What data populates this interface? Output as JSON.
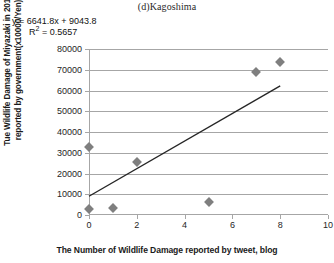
{
  "chart_data": {
    "type": "scatter",
    "title": "(d)Kagoshima",
    "xlabel": "The Number of Wildlife Damage reported by tweet, blog",
    "ylabel_line1": "Tue Wildlife Damage of Miyazaki in 2013",
    "ylabel_line2": "reported by government(x10000/Yen)",
    "x": [
      0,
      0,
      1,
      2,
      5,
      7,
      8
    ],
    "y": [
      33000,
      3000,
      3500,
      25500,
      6500,
      69000,
      73500
    ],
    "points": [
      {
        "x": 0,
        "y": 33000
      },
      {
        "x": 0,
        "y": 3000
      },
      {
        "x": 1,
        "y": 3500
      },
      {
        "x": 2,
        "y": 25500
      },
      {
        "x": 5,
        "y": 6500
      },
      {
        "x": 7,
        "y": 69000
      },
      {
        "x": 8,
        "y": 73500
      }
    ],
    "xlim": [
      0,
      10
    ],
    "ylim": [
      0,
      80000
    ],
    "xticks": [
      0,
      2,
      4,
      6,
      8,
      10
    ],
    "yticks": [
      0,
      10000,
      20000,
      30000,
      40000,
      50000,
      60000,
      70000,
      80000
    ],
    "xtick_labels": [
      "0",
      "2",
      "4",
      "6",
      "8",
      "10"
    ],
    "ytick_labels": [
      "0",
      "10000",
      "20000",
      "30000",
      "40000",
      "50000",
      "60000",
      "70000",
      "80000"
    ],
    "grid": true,
    "legend": false,
    "trendline": {
      "type": "linear",
      "slope": 6641.8,
      "intercept": 9043.8,
      "r_squared": 0.5657,
      "equation_text": "y = 6641.8x + 9043.8",
      "r2_prefix": "R",
      "r2_exponent": "2",
      "r2_value": " = 0.5657",
      "x_start": 0,
      "x_end": 8
    },
    "colors": {
      "marker": "#7f7f7f",
      "trendline": "#262626",
      "gridline": "#a6a6a6",
      "text": "#1a1a1a"
    }
  }
}
